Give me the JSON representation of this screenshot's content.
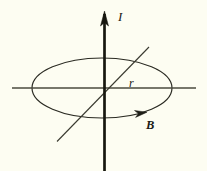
{
  "figure": {
    "background_color": "#fdfdf2",
    "ink_color": "#1a1a15",
    "width": 207,
    "height": 171
  },
  "labels": {
    "current": "I",
    "radius": "r",
    "bfield": "B"
  },
  "geometry": {
    "center": {
      "x": 104,
      "y": 88
    },
    "wire": {
      "x": 104.5,
      "y_top": 12,
      "y_bottom": 171,
      "stroke_width": 2.6,
      "arrow_tip_y": 12,
      "arrow_half_width": 4.2,
      "arrow_length": 14
    },
    "ellipse": {
      "cx": 102,
      "cy": 88,
      "rx": 70,
      "ry": 30,
      "stroke_width": 1.2
    },
    "horizontal_axis": {
      "x1": 12,
      "x2": 196,
      "y": 88,
      "stroke_width": 1.5
    },
    "diagonal_axis": {
      "x1": 57,
      "y1": 141,
      "x2": 149,
      "y2": 47,
      "stroke_width": 1.1
    },
    "field_arrow": {
      "x": 143,
      "y": 114,
      "angle_deg": 28,
      "size": 8
    }
  },
  "physics_data": {
    "type": "field-diagram",
    "quantities": [
      {
        "symbol": "I",
        "name": "current",
        "direction": "upward along wire"
      },
      {
        "symbol": "r",
        "name": "radius",
        "description": "distance from wire to field loop"
      },
      {
        "symbol": "B",
        "name": "magnetic field",
        "direction": "counterclockwise loop around wire"
      }
    ]
  }
}
